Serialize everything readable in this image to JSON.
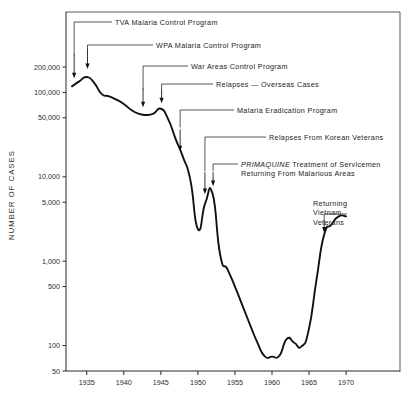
{
  "figure": {
    "y_axis_label": "NUMBER OF CASES",
    "y_ticks": [
      {
        "value": 200000,
        "label": "200,000"
      },
      {
        "value": 100000,
        "label": "100,000"
      },
      {
        "value": 50000,
        "label": "50,000"
      },
      {
        "value": 10000,
        "label": "10,000"
      },
      {
        "value": 5000,
        "label": "5,000"
      },
      {
        "value": 1000,
        "label": "1,000"
      },
      {
        "value": 500,
        "label": "500"
      },
      {
        "value": 100,
        "label": "100"
      },
      {
        "value": 50,
        "label": "50"
      }
    ],
    "x_ticks": [
      {
        "value": 1935,
        "label": "1935"
      },
      {
        "value": 1940,
        "label": "1940"
      },
      {
        "value": 1945,
        "label": "1945"
      },
      {
        "value": 1950,
        "label": "1950"
      },
      {
        "value": 1955,
        "label": "1955"
      },
      {
        "value": 1960,
        "label": "1960"
      },
      {
        "value": 1965,
        "label": "1965"
      },
      {
        "value": 1970,
        "label": "1970"
      }
    ],
    "annotations": [
      {
        "id": "tva",
        "text": "TVA Malaria Control Program"
      },
      {
        "id": "wpa",
        "text": "WPA Malaria Control Program"
      },
      {
        "id": "war-areas",
        "text": "War Areas Control Program"
      },
      {
        "id": "relapses-overseas",
        "text": "Relapses — Overseas Cases"
      },
      {
        "id": "eradication",
        "text": "Malaria Eradication Program"
      },
      {
        "id": "korean",
        "text": "Relapses From Korean Veterans"
      },
      {
        "id": "primaquine",
        "text_em": "PRIMAQUINE",
        "text": " Treatment of Servicemen",
        "text2": "Returning From Malarious Areas"
      },
      {
        "id": "vietnam",
        "line1": "Returning",
        "line2": "Vietnam",
        "line3": "Veterans"
      }
    ]
  },
  "chart_data": {
    "type": "line",
    "title": "",
    "xlabel": "",
    "ylabel": "NUMBER OF CASES",
    "yscale": "log",
    "ylim": [
      50,
      260000
    ],
    "xlim": [
      1932.2,
      1971.3
    ],
    "grid": false,
    "legend": null,
    "series": [
      {
        "name": "Reported malaria cases, United States",
        "x": [
          1933,
          1934,
          1935,
          1936,
          1937,
          1938,
          1939,
          1940,
          1941,
          1942,
          1943,
          1944,
          1945,
          1946,
          1947,
          1948,
          1949,
          1950,
          1951,
          1952,
          1953,
          1954,
          1955,
          1956,
          1957,
          1958,
          1959,
          1960,
          1961,
          1962,
          1963,
          1964,
          1965,
          1966,
          1967,
          1968,
          1969,
          1970
        ],
        "values": [
          118000,
          135000,
          152000,
          130000,
          96000,
          90000,
          82000,
          73000,
          62000,
          56000,
          54000,
          56000,
          64000,
          48000,
          28000,
          17000,
          9000,
          2400,
          4900,
          6200,
          1200,
          800,
          500,
          300,
          180,
          110,
          75,
          74,
          76,
          120,
          108,
          98,
          160,
          600,
          2000,
          2700,
          3400,
          3400
        ]
      }
    ],
    "annotations": [
      {
        "label": "TVA Malaria Control Program",
        "x": 1933.2,
        "y": 118000
      },
      {
        "label": "WPA Malaria Control Program",
        "x": 1935.0,
        "y": 152000
      },
      {
        "label": "War Areas Control Program",
        "x": 1942.4,
        "y": 56000
      },
      {
        "label": "Relapses — Overseas Cases",
        "x": 1945.0,
        "y": 64000
      },
      {
        "label": "Malaria Eradication Program",
        "x": 1947.4,
        "y": 22000
      },
      {
        "label": "Relapses From Korean Veterans",
        "x": 1951.0,
        "y": 4900
      },
      {
        "label": "PRIMAQUINE Treatment of Servicemen Returning From Malarious Areas",
        "x": 1952.0,
        "y": 6200
      },
      {
        "label": "Returning Vietnam Veterans",
        "x": 1967.0,
        "y": 2000
      }
    ]
  }
}
